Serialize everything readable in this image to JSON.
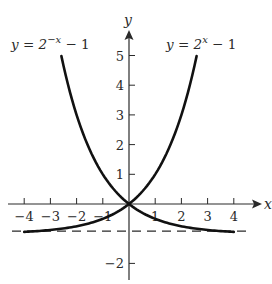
{
  "chart_data": {
    "type": "line",
    "title": "",
    "xlabel": "x",
    "ylabel": "y",
    "xlim": [
      -4.5,
      5
    ],
    "ylim": [
      -2.5,
      5.8
    ],
    "grid": false,
    "x_ticks": [
      -4,
      -3,
      -2,
      -1,
      1,
      2,
      3,
      4
    ],
    "x_tick_labels": [
      "−4",
      "−3",
      "−2",
      "−1",
      "1",
      "2",
      "3",
      "4"
    ],
    "y_ticks": [
      5,
      4,
      3,
      2,
      1,
      -2
    ],
    "y_tick_labels": [
      "5",
      "4",
      "3",
      "2",
      "1",
      "−2"
    ],
    "series": [
      {
        "name": "y = 2^(−x) − 1",
        "label_base": "y = 2",
        "label_exp": "−x",
        "label_tail": " − 1",
        "x": [
          -2.58,
          -2.5,
          -2,
          -1.5,
          -1,
          -0.5,
          0,
          0.5,
          1,
          1.5,
          2,
          2.5,
          3,
          3.5,
          4
        ],
        "values": [
          5.0,
          4.66,
          3.0,
          1.83,
          1.0,
          0.41,
          0,
          -0.29,
          -0.5,
          -0.65,
          -0.75,
          -0.82,
          -0.875,
          -0.91,
          -0.94
        ]
      },
      {
        "name": "y = 2^x − 1",
        "label_base": "y = 2",
        "label_exp": "x",
        "label_tail": " − 1",
        "x": [
          -4,
          -3.5,
          -3,
          -2.5,
          -2,
          -1.5,
          -1,
          -0.5,
          0,
          0.5,
          1,
          1.5,
          2,
          2.5,
          2.58
        ],
        "values": [
          -0.94,
          -0.91,
          -0.875,
          -0.82,
          -0.75,
          -0.65,
          -0.5,
          -0.29,
          0,
          0.41,
          1.0,
          1.83,
          3.0,
          4.66,
          5.0
        ]
      }
    ],
    "annotations": [
      {
        "type": "horizontal_asymptote",
        "y": -1,
        "style": "dashed"
      }
    ]
  },
  "colors": {
    "ink": "#1a1a1a",
    "background": "#ffffff"
  }
}
